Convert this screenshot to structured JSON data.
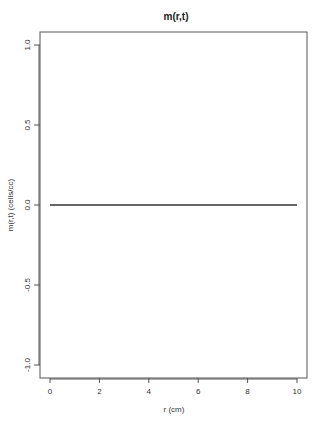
{
  "chart_data": {
    "type": "line",
    "title": "m(r,t)",
    "xlabel": "r (cm)",
    "ylabel": "m(r,t) (cells/cc)",
    "xlim": [
      0,
      10
    ],
    "ylim": [
      -1.0,
      1.0
    ],
    "x_ticks": [
      0,
      2,
      4,
      6,
      8,
      10
    ],
    "x_tick_labels": [
      "0",
      "2",
      "4",
      "6",
      "8",
      "10"
    ],
    "y_ticks": [
      -1.0,
      -0.5,
      0.0,
      0.5,
      1.0
    ],
    "y_tick_labels": [
      "-1.0",
      "-0.5",
      "0.0",
      "0.5",
      "1.0"
    ],
    "grid": false,
    "legend": null,
    "series": [
      {
        "name": "m(r,t)",
        "color": "#333333",
        "x": [
          0,
          2,
          4,
          6,
          8,
          10
        ],
        "y": [
          0,
          0,
          0,
          0,
          0,
          0
        ]
      }
    ]
  },
  "layout": {
    "plot_box": {
      "left": 40,
      "top": 32,
      "right": 307,
      "bottom": 378
    },
    "x_px": {
      "min_val": 0,
      "min_px": 50,
      "max_val": 10,
      "max_px": 297
    },
    "y_px": {
      "min_val": -1.0,
      "min_px": 365,
      "max_val": 1.0,
      "max_px": 45
    }
  }
}
